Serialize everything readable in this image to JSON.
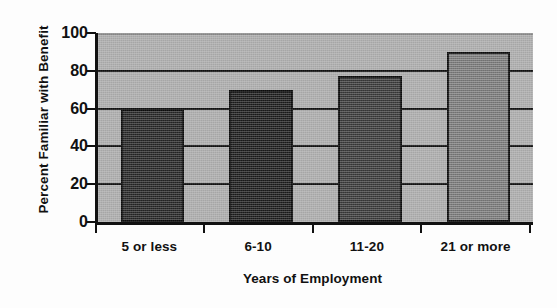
{
  "figure": {
    "scan_artifact_text": "CHAPTER SUMMARY",
    "background_color": "#fdfdfd"
  },
  "chart_data": {
    "type": "bar",
    "title": "",
    "xlabel": "Years of Employment",
    "ylabel": "Percent Familiar with Benefit",
    "categories": [
      "5 or less",
      "6-10",
      "11-20",
      "21 or more"
    ],
    "values": [
      60,
      70,
      77,
      90
    ],
    "ylim": [
      0,
      100
    ],
    "yticks": [
      0,
      20,
      40,
      60,
      80,
      100
    ],
    "ytick_labels": [
      "0",
      "20",
      "40",
      "60",
      "80",
      "100"
    ],
    "grid": true,
    "grid_axis": "y",
    "legend": "none",
    "bar_colors": [
      "#262626",
      "#1c1c1c",
      "#3a3a3a",
      "#7d7d7d"
    ],
    "bar_edge_color": "#0d0d0d",
    "plot_background_color": "#b0b0b0",
    "axis_color": "#111111",
    "bars": [
      {
        "category": "5 or less",
        "value": 60,
        "color": "#262626"
      },
      {
        "category": "6-10",
        "value": 70,
        "color": "#1c1c1c"
      },
      {
        "category": "11-20",
        "value": 77,
        "color": "#3a3a3a"
      },
      {
        "category": "21 or more",
        "value": 90,
        "color": "#7d7d7d"
      }
    ]
  }
}
